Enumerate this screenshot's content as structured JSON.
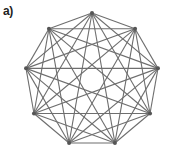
{
  "panel": {
    "label": "a)"
  },
  "graph": {
    "type": "complete-graph",
    "node_count": 9,
    "center": [
      92,
      80
    ],
    "radius": 67,
    "start_angle_deg": -90,
    "edge_color": "#6e6e6e",
    "node_color": "#555555"
  }
}
